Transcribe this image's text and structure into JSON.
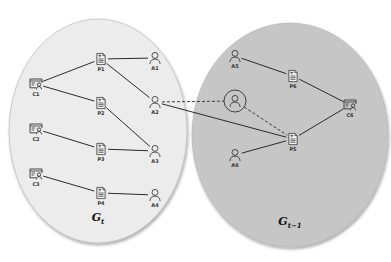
{
  "diagram": {
    "type": "graph-comparison",
    "graphs": [
      {
        "id": "gt",
        "label": "G",
        "subscript": "t",
        "fill": "#ececec",
        "ellipse": {
          "cx": 98,
          "cy": 131,
          "rx": 89,
          "ry": 112
        }
      },
      {
        "id": "gt1",
        "label": "G",
        "subscript": "t−1",
        "fill": "#c6c6c6",
        "ellipse": {
          "cx": 290,
          "cy": 135,
          "rx": 98,
          "ry": 112
        }
      }
    ],
    "nodes": [
      {
        "id": "C1",
        "label": "C1",
        "kind": "certificate",
        "x": 36,
        "y": 84,
        "graph": "gt"
      },
      {
        "id": "C2",
        "label": "C2",
        "kind": "certificate",
        "x": 36,
        "y": 129,
        "graph": "gt"
      },
      {
        "id": "C3",
        "label": "C3",
        "kind": "certificate",
        "x": 36,
        "y": 174,
        "graph": "gt"
      },
      {
        "id": "P1",
        "label": "P1",
        "kind": "document",
        "x": 101,
        "y": 59,
        "graph": "gt"
      },
      {
        "id": "P2",
        "label": "P2",
        "kind": "document",
        "x": 101,
        "y": 103,
        "graph": "gt"
      },
      {
        "id": "P3",
        "label": "P3",
        "kind": "document",
        "x": 101,
        "y": 149,
        "graph": "gt"
      },
      {
        "id": "P4",
        "label": "P4",
        "kind": "document",
        "x": 101,
        "y": 193,
        "graph": "gt"
      },
      {
        "id": "A1",
        "label": "A1",
        "kind": "person",
        "x": 155,
        "y": 58,
        "graph": "gt"
      },
      {
        "id": "A2",
        "label": "A2",
        "kind": "person",
        "x": 155,
        "y": 102,
        "graph": "gt"
      },
      {
        "id": "A3",
        "label": "A3",
        "kind": "person",
        "x": 155,
        "y": 151,
        "graph": "gt"
      },
      {
        "id": "A4",
        "label": "A4",
        "kind": "person",
        "x": 155,
        "y": 195,
        "graph": "gt"
      },
      {
        "id": "A5",
        "label": "A5",
        "kind": "person",
        "x": 235,
        "y": 56,
        "graph": "gt1"
      },
      {
        "id": "A6",
        "label": "A6",
        "kind": "person",
        "x": 235,
        "y": 155,
        "graph": "gt1"
      },
      {
        "id": "P6",
        "label": "P6",
        "kind": "document",
        "x": 293,
        "y": 76,
        "graph": "gt1"
      },
      {
        "id": "P5",
        "label": "P5",
        "kind": "document",
        "x": 293,
        "y": 139,
        "graph": "gt1"
      },
      {
        "id": "C6",
        "label": "C6",
        "kind": "certificate",
        "x": 350,
        "y": 105,
        "graph": "gt1"
      },
      {
        "id": "X",
        "label": "",
        "kind": "person-circled",
        "x": 235,
        "y": 101,
        "graph": "gt1"
      }
    ],
    "edges": [
      {
        "from": "C1",
        "to": "P1",
        "style": "solid"
      },
      {
        "from": "C1",
        "to": "P2",
        "style": "solid"
      },
      {
        "from": "C2",
        "to": "P3",
        "style": "solid"
      },
      {
        "from": "C3",
        "to": "P4",
        "style": "solid"
      },
      {
        "from": "P1",
        "to": "A1",
        "style": "solid"
      },
      {
        "from": "P1",
        "to": "A2",
        "style": "solid"
      },
      {
        "from": "P2",
        "to": "A3",
        "style": "solid"
      },
      {
        "from": "P3",
        "to": "A3",
        "style": "solid"
      },
      {
        "from": "P4",
        "to": "A4",
        "style": "solid"
      },
      {
        "from": "A5",
        "to": "P6",
        "style": "solid"
      },
      {
        "from": "P6",
        "to": "C6",
        "style": "solid"
      },
      {
        "from": "A6",
        "to": "P5",
        "style": "solid"
      },
      {
        "from": "P5",
        "to": "C6",
        "style": "solid"
      },
      {
        "from": "A2",
        "to": "P5",
        "style": "solid"
      },
      {
        "from": "A2",
        "to": "X",
        "style": "dashed"
      },
      {
        "from": "X",
        "to": "P5",
        "style": "dashed"
      }
    ]
  }
}
